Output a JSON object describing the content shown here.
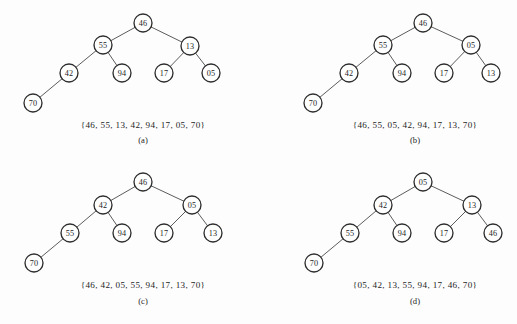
{
  "figure": {
    "background_color": "#fdfdfd",
    "node_fill": "#ffffff",
    "node_stroke": "#2e2e2e",
    "edge_color": "#4a4a4a",
    "text_color": "#1d1d1d",
    "node_radius": 9
  },
  "panels": [
    {
      "id": "a",
      "caption_letter": "(a)",
      "caption_set": "{46, 55, 13, 42, 94, 17, 05, 70}",
      "caption_set_x": 143,
      "caption_set_y": 128,
      "caption_letter_x": 143,
      "caption_letter_y": 143,
      "nodes": [
        {
          "name": "node-46",
          "label": "46",
          "x": 143,
          "y": 23
        },
        {
          "name": "node-55",
          "label": "55",
          "x": 103,
          "y": 45
        },
        {
          "name": "node-13",
          "label": "13",
          "x": 190,
          "y": 46
        },
        {
          "name": "node-42",
          "label": "42",
          "x": 69,
          "y": 73
        },
        {
          "name": "node-94",
          "label": "94",
          "x": 122,
          "y": 73
        },
        {
          "name": "node-17",
          "label": "17",
          "x": 164,
          "y": 73
        },
        {
          "name": "node-05",
          "label": "05",
          "x": 211,
          "y": 73
        },
        {
          "name": "node-70",
          "label": "70",
          "x": 33,
          "y": 103
        }
      ],
      "edges": [
        {
          "name": "edge-46-55",
          "x1": 143,
          "y1": 23,
          "x2": 103,
          "y2": 45
        },
        {
          "name": "edge-46-13",
          "x1": 143,
          "y1": 23,
          "x2": 190,
          "y2": 46
        },
        {
          "name": "edge-55-42",
          "x1": 103,
          "y1": 45,
          "x2": 69,
          "y2": 73
        },
        {
          "name": "edge-55-94",
          "x1": 103,
          "y1": 45,
          "x2": 122,
          "y2": 73
        },
        {
          "name": "edge-13-17",
          "x1": 190,
          "y1": 46,
          "x2": 164,
          "y2": 73
        },
        {
          "name": "edge-13-05",
          "x1": 190,
          "y1": 46,
          "x2": 211,
          "y2": 73
        },
        {
          "name": "edge-42-70",
          "x1": 69,
          "y1": 73,
          "x2": 33,
          "y2": 103
        }
      ]
    },
    {
      "id": "b",
      "caption_letter": "(b)",
      "caption_set": "{46, 55, 05, 42, 94, 17, 13, 70}",
      "caption_set_x": 415,
      "caption_set_y": 128,
      "caption_letter_x": 415,
      "caption_letter_y": 143,
      "nodes": [
        {
          "name": "node-46",
          "label": "46",
          "x": 423,
          "y": 23
        },
        {
          "name": "node-55",
          "label": "55",
          "x": 383,
          "y": 45
        },
        {
          "name": "node-05",
          "label": "05",
          "x": 471,
          "y": 45
        },
        {
          "name": "node-42",
          "label": "42",
          "x": 349,
          "y": 73
        },
        {
          "name": "node-94",
          "label": "94",
          "x": 402,
          "y": 73
        },
        {
          "name": "node-17",
          "label": "17",
          "x": 444,
          "y": 73
        },
        {
          "name": "node-13",
          "label": "13",
          "x": 491,
          "y": 73
        },
        {
          "name": "node-70",
          "label": "70",
          "x": 313,
          "y": 103
        }
      ],
      "edges": [
        {
          "name": "edge-46-55",
          "x1": 423,
          "y1": 23,
          "x2": 383,
          "y2": 45
        },
        {
          "name": "edge-46-05",
          "x1": 423,
          "y1": 23,
          "x2": 471,
          "y2": 45
        },
        {
          "name": "edge-55-42",
          "x1": 383,
          "y1": 45,
          "x2": 349,
          "y2": 73
        },
        {
          "name": "edge-55-94",
          "x1": 383,
          "y1": 45,
          "x2": 402,
          "y2": 73
        },
        {
          "name": "edge-05-17",
          "x1": 471,
          "y1": 45,
          "x2": 444,
          "y2": 73
        },
        {
          "name": "edge-05-13",
          "x1": 471,
          "y1": 45,
          "x2": 491,
          "y2": 73
        },
        {
          "name": "edge-42-70",
          "x1": 349,
          "y1": 73,
          "x2": 313,
          "y2": 103
        }
      ]
    },
    {
      "id": "c",
      "caption_letter": "(c)",
      "caption_set": "{46, 42, 05, 55, 94, 17, 13, 70}",
      "caption_set_x": 143,
      "caption_set_y": 288,
      "caption_letter_x": 143,
      "caption_letter_y": 304,
      "nodes": [
        {
          "name": "node-46",
          "label": "46",
          "x": 143,
          "y": 182
        },
        {
          "name": "node-42",
          "label": "42",
          "x": 103,
          "y": 205
        },
        {
          "name": "node-05",
          "label": "05",
          "x": 192,
          "y": 205
        },
        {
          "name": "node-55",
          "label": "55",
          "x": 70,
          "y": 233
        },
        {
          "name": "node-94",
          "label": "94",
          "x": 122,
          "y": 233
        },
        {
          "name": "node-17",
          "label": "17",
          "x": 164,
          "y": 233
        },
        {
          "name": "node-13",
          "label": "13",
          "x": 213,
          "y": 233
        },
        {
          "name": "node-70",
          "label": "70",
          "x": 34,
          "y": 263
        }
      ],
      "edges": [
        {
          "name": "edge-46-42",
          "x1": 143,
          "y1": 182,
          "x2": 103,
          "y2": 205
        },
        {
          "name": "edge-46-05",
          "x1": 143,
          "y1": 182,
          "x2": 192,
          "y2": 205
        },
        {
          "name": "edge-42-55",
          "x1": 103,
          "y1": 205,
          "x2": 70,
          "y2": 233
        },
        {
          "name": "edge-42-94",
          "x1": 103,
          "y1": 205,
          "x2": 122,
          "y2": 233
        },
        {
          "name": "edge-05-17",
          "x1": 192,
          "y1": 205,
          "x2": 164,
          "y2": 233
        },
        {
          "name": "edge-05-13",
          "x1": 192,
          "y1": 205,
          "x2": 213,
          "y2": 233
        },
        {
          "name": "edge-55-70",
          "x1": 70,
          "y1": 233,
          "x2": 34,
          "y2": 263
        }
      ]
    },
    {
      "id": "d",
      "caption_letter": "(d)",
      "caption_set": "{05, 42, 13, 55, 94, 17, 46, 70}",
      "caption_set_x": 415,
      "caption_set_y": 288,
      "caption_letter_x": 415,
      "caption_letter_y": 304,
      "nodes": [
        {
          "name": "node-05",
          "label": "05",
          "x": 423,
          "y": 182
        },
        {
          "name": "node-42",
          "label": "42",
          "x": 383,
          "y": 205
        },
        {
          "name": "node-13",
          "label": "13",
          "x": 472,
          "y": 205
        },
        {
          "name": "node-55",
          "label": "55",
          "x": 350,
          "y": 233
        },
        {
          "name": "node-94",
          "label": "94",
          "x": 402,
          "y": 233
        },
        {
          "name": "node-17",
          "label": "17",
          "x": 444,
          "y": 233
        },
        {
          "name": "node-46",
          "label": "46",
          "x": 493,
          "y": 233
        },
        {
          "name": "node-70",
          "label": "70",
          "x": 314,
          "y": 263
        }
      ],
      "edges": [
        {
          "name": "edge-05-42",
          "x1": 423,
          "y1": 182,
          "x2": 383,
          "y2": 205
        },
        {
          "name": "edge-05-13",
          "x1": 423,
          "y1": 182,
          "x2": 472,
          "y2": 205
        },
        {
          "name": "edge-42-55",
          "x1": 383,
          "y1": 205,
          "x2": 350,
          "y2": 233
        },
        {
          "name": "edge-42-94",
          "x1": 383,
          "y1": 205,
          "x2": 402,
          "y2": 233
        },
        {
          "name": "edge-13-17",
          "x1": 472,
          "y1": 205,
          "x2": 444,
          "y2": 233
        },
        {
          "name": "edge-13-46",
          "x1": 472,
          "y1": 205,
          "x2": 493,
          "y2": 233
        },
        {
          "name": "edge-55-70",
          "x1": 350,
          "y1": 233,
          "x2": 314,
          "y2": 263
        }
      ]
    }
  ]
}
